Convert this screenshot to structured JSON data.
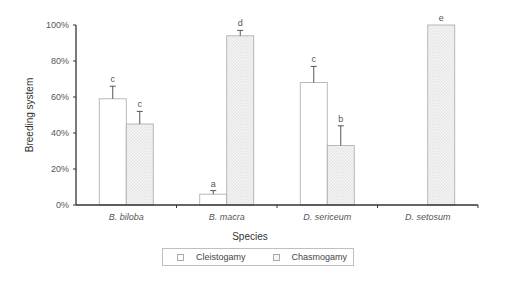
{
  "chart_data": {
    "type": "bar",
    "title": "",
    "xlabel": "Species",
    "ylabel": "Breeding system",
    "ylim": [
      0,
      100
    ],
    "yticks": [
      "0%",
      "20%",
      "40%",
      "60%",
      "80%",
      "100%"
    ],
    "grid": false,
    "legend_position": "bottom",
    "categories": [
      "B. biloba",
      "B. macra",
      "D. sericeum",
      "D. setosum"
    ],
    "series": [
      {
        "name": "Cleistogamy",
        "fill": "plain",
        "values": [
          59,
          6,
          68,
          0
        ],
        "errors": [
          7,
          2,
          9,
          0
        ],
        "significance": [
          "c",
          "a",
          "c",
          ""
        ]
      },
      {
        "name": "Chasmogamy",
        "fill": "dotted",
        "values": [
          45,
          94,
          33,
          100
        ],
        "errors": [
          7,
          3,
          11,
          0
        ],
        "significance": [
          "c",
          "d",
          "b",
          "e"
        ]
      }
    ]
  },
  "legend": {
    "items": [
      {
        "label": "Cleistogamy",
        "icon": "plain-square-swatch"
      },
      {
        "label": "Chasmogamy",
        "icon": "dotted-square-swatch"
      }
    ]
  },
  "colors": {
    "axis": "#333333",
    "bar_border": "#a8a8a8",
    "plain_fill": "#ffffff",
    "dotted_fill": "#f2f2f2",
    "text": "#555555"
  }
}
